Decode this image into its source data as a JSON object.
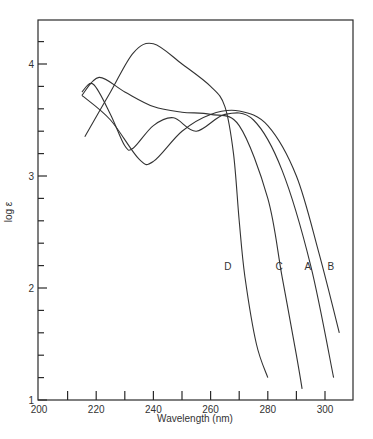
{
  "chart_data": {
    "type": "line",
    "title": "",
    "xlabel": "Wavelength (nm)",
    "ylabel": "log ε",
    "xlim": [
      200,
      310
    ],
    "ylim": [
      1,
      4.35
    ],
    "xticks": [
      200,
      220,
      240,
      260,
      280,
      300
    ],
    "xminor": [
      210,
      230,
      250,
      270,
      290
    ],
    "yticks": [
      1,
      2,
      3,
      4
    ],
    "yminor": [
      1.2,
      1.4,
      1.6,
      1.8,
      2.2,
      2.4,
      2.6,
      2.8,
      3.2,
      3.4,
      3.6,
      3.8,
      4.2
    ],
    "grid": false,
    "legend": "inline curve labels",
    "series": [
      {
        "name": "A",
        "label_pos": [
          294,
          2.2
        ],
        "x": [
          215,
          219,
          225,
          230,
          233,
          240,
          247,
          255,
          265,
          275,
          285,
          295,
          303
        ],
        "y": [
          3.75,
          3.82,
          3.55,
          3.27,
          3.25,
          3.45,
          3.52,
          3.4,
          3.55,
          3.5,
          3.05,
          2.2,
          1.2
        ]
      },
      {
        "name": "B",
        "label_pos": [
          302,
          2.2
        ],
        "x": [
          215,
          225,
          235,
          240,
          250,
          260,
          270,
          280,
          290,
          298,
          305
        ],
        "y": [
          3.72,
          3.5,
          3.15,
          3.13,
          3.4,
          3.55,
          3.58,
          3.45,
          3.0,
          2.3,
          1.6
        ]
      },
      {
        "name": "C",
        "label_pos": [
          284,
          2.2
        ],
        "x": [
          215,
          221,
          230,
          240,
          250,
          260,
          270,
          280,
          285,
          290,
          292
        ],
        "y": [
          3.72,
          3.88,
          3.75,
          3.62,
          3.57,
          3.55,
          3.45,
          2.8,
          2.1,
          1.4,
          1.1
        ]
      },
      {
        "name": "D",
        "label_pos": [
          266,
          2.2
        ],
        "x": [
          216,
          225,
          233,
          240,
          250,
          260,
          265,
          268,
          270,
          272,
          276,
          280
        ],
        "y": [
          3.35,
          3.75,
          4.1,
          4.18,
          4.0,
          3.8,
          3.62,
          3.2,
          2.6,
          2.1,
          1.5,
          1.2
        ]
      }
    ]
  }
}
